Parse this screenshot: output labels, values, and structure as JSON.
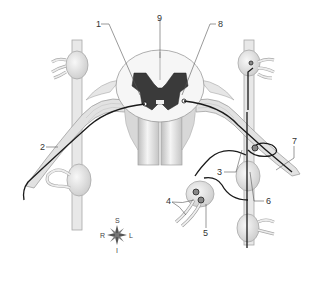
{
  "diagram": {
    "colors": {
      "gray_matter": "#3a3a3a",
      "white_matter": "#f4f4f4",
      "nerve_fill": "#e6e6e6",
      "nerve_outline": "#9a9a9a",
      "neuron_path": "#1a1a1a",
      "leader_line": "#555555",
      "background": "#ffffff"
    },
    "labels": [
      {
        "id": "1",
        "text": "1",
        "x": 96,
        "y": 20
      },
      {
        "id": "2",
        "text": "2",
        "x": 40,
        "y": 146
      },
      {
        "id": "3",
        "text": "3",
        "x": 217,
        "y": 168
      },
      {
        "id": "4",
        "text": "4",
        "x": 167,
        "y": 198
      },
      {
        "id": "5",
        "text": "5",
        "x": 203,
        "y": 231
      },
      {
        "id": "6",
        "text": "6",
        "x": 266,
        "y": 197
      },
      {
        "id": "7",
        "text": "7",
        "x": 292,
        "y": 138
      },
      {
        "id": "8",
        "text": "8",
        "x": 219,
        "y": 20
      },
      {
        "id": "9",
        "text": "9",
        "x": 157,
        "y": 14
      }
    ],
    "compass": {
      "north": "S",
      "south": "I",
      "west": "R",
      "east": "L"
    }
  }
}
